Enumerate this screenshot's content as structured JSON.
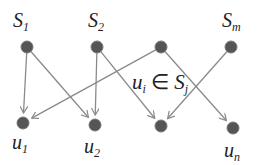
{
  "diagram": {
    "type": "bipartite-graph",
    "top_nodes": [
      {
        "id": "S1",
        "label_main": "S",
        "label_sub": "1",
        "x": 27,
        "y": 47
      },
      {
        "id": "S2",
        "label_main": "S",
        "label_sub": "2",
        "x": 97,
        "y": 47
      },
      {
        "id": "S3",
        "label_main": "",
        "label_sub": "",
        "x": 161,
        "y": 47
      },
      {
        "id": "Sm",
        "label_main": "S",
        "label_sub": "m",
        "x": 231,
        "y": 47
      }
    ],
    "bottom_nodes": [
      {
        "id": "u1",
        "label_main": "u",
        "label_sub": "1",
        "x": 23,
        "y": 123
      },
      {
        "id": "u2",
        "label_main": "u",
        "label_sub": "2",
        "x": 95,
        "y": 125
      },
      {
        "id": "u3",
        "label_main": "",
        "label_sub": "",
        "x": 161,
        "y": 126
      },
      {
        "id": "un",
        "label_main": "u",
        "label_sub": "n",
        "x": 233,
        "y": 128
      }
    ],
    "edges": [
      {
        "from": "S1",
        "to": "u1"
      },
      {
        "from": "S1",
        "to": "u2"
      },
      {
        "from": "S2",
        "to": "u2"
      },
      {
        "from": "S2",
        "to": "u3"
      },
      {
        "from": "S3",
        "to": "u1"
      },
      {
        "from": "S3",
        "to": "un"
      },
      {
        "from": "Sm",
        "to": "u3"
      }
    ],
    "annotation": {
      "text_u": "u",
      "sub_i": "i",
      "symbol": "∈",
      "text_S": "S",
      "sub_j": "j"
    },
    "colors": {
      "node": "#555555",
      "edge": "#8a8a8a",
      "text": "#222222"
    }
  }
}
